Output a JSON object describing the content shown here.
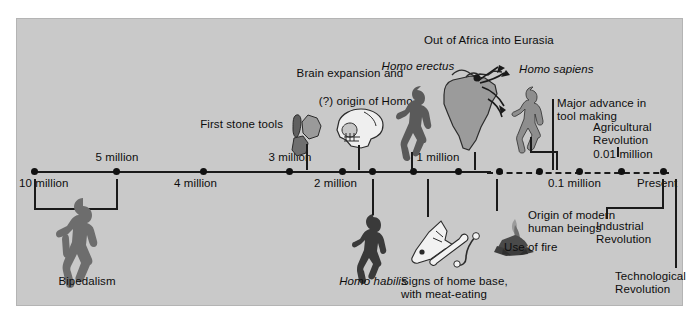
{
  "figure": {
    "title_present": false,
    "background_color": "#c9c9c9",
    "ink_color": "#0d0d0d"
  },
  "timeline": {
    "orientation": "horizontal",
    "direction": "past-to-present",
    "style": "solid line left of 1 million, dashed line right of ~0.8 million",
    "above_labels": [
      {
        "text": "5 million",
        "x": 115
      },
      {
        "text": "3 million",
        "x": 288
      },
      {
        "text": "1 million",
        "x": 435
      },
      {
        "text": "0.01 million",
        "x": 620
      }
    ],
    "below_labels": [
      {
        "text": "10 million",
        "x": 33
      },
      {
        "text": "4 million",
        "x": 202
      },
      {
        "text": "2 million",
        "x": 341
      },
      {
        "text": "0.1 million",
        "x": 578
      },
      {
        "text": "Present",
        "x": 662
      }
    ],
    "tick_positions_px": [
      33,
      115,
      202,
      288,
      341,
      371,
      412,
      457,
      498,
      538,
      578,
      620,
      662
    ]
  },
  "events": {
    "bipedalism": "Bipedalism",
    "first_stone_tools": "First stone tools",
    "brain_expansion_line1": "Brain expansion and",
    "brain_expansion_line2": "(?) origin of ",
    "brain_expansion_homo": "Homo",
    "homo_habilis": "Homo habilis",
    "homo_erectus": "Homo erectus",
    "out_of_africa": "Out of Africa into Eurasia",
    "homo_sapiens": "Homo sapiens",
    "major_advance_line1": "Major advance in",
    "major_advance_line2": "tool making",
    "agricultural_line1": "Agricultural",
    "agricultural_line2": "Revolution",
    "industrial_line1": "Industrial",
    "industrial_line2": "Revolution",
    "technological_line1": "Technological",
    "technological_line2": "Revolution",
    "signs_home_base_line1": "Signs of home base,",
    "signs_home_base_line2": "with meat-eating",
    "use_of_fire": "Use of fire",
    "origin_modern_line1": "Origin of modern",
    "origin_modern_line2": "human beings"
  },
  "icons": {
    "bipedal_figure": "hominid-silhouette-icon",
    "stone_tools": "stone-tools-icon",
    "skull": "skull-icon",
    "habilis_figure": "homo-habilis-silhouette-icon",
    "erectus_figure": "homo-erectus-silhouette-icon",
    "africa_map": "africa-migration-map-icon",
    "sapiens_figure": "homo-sapiens-silhouette-icon",
    "bones": "animal-bones-icon",
    "campfire": "campfire-icon"
  }
}
